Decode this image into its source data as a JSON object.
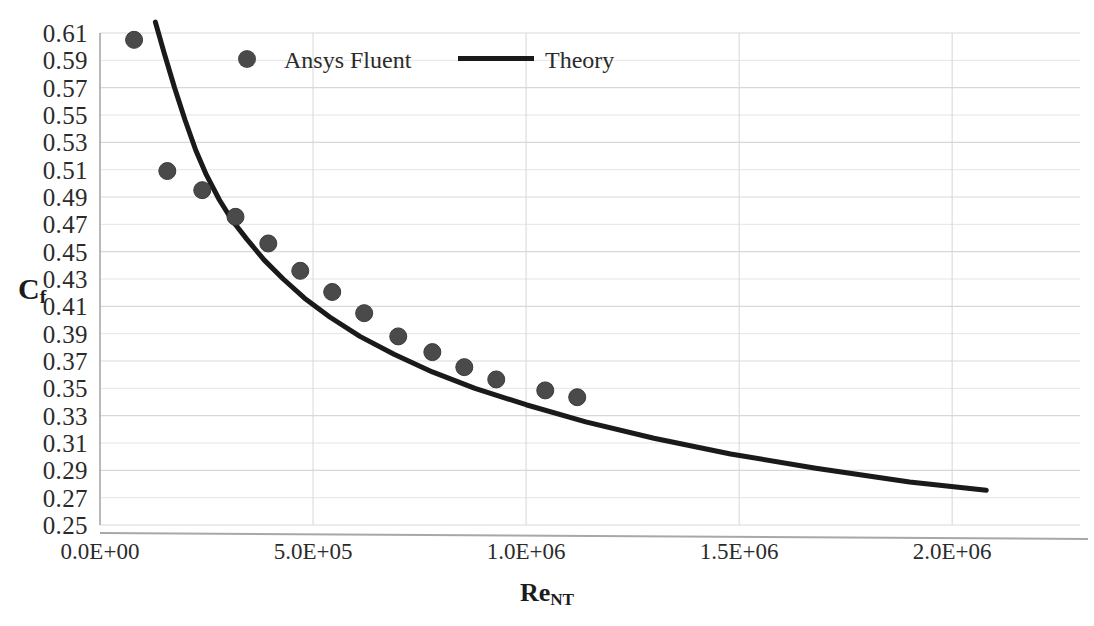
{
  "chart_data": {
    "type": "scatter",
    "title": "",
    "xlabel": "Re_NT",
    "ylabel": "C",
    "xlabel_base": "Re",
    "xlabel_sub": "NT",
    "ylabel_base": "C",
    "ylabel_sub": "f",
    "grid": true,
    "legend_position": "top-center-inside",
    "xlim": [
      0,
      2300000
    ],
    "ylim": [
      0.25,
      0.61
    ],
    "xticks": [
      0,
      500000,
      1000000,
      1500000,
      2000000
    ],
    "xtick_labels": [
      "0.0E+00",
      "5.0E+05",
      "1.0E+06",
      "1.5E+06",
      "2.0E+06"
    ],
    "yticks": [
      0.25,
      0.27,
      0.29,
      0.31,
      0.33,
      0.35,
      0.37,
      0.39,
      0.41,
      0.43,
      0.45,
      0.47,
      0.49,
      0.51,
      0.53,
      0.55,
      0.57,
      0.59,
      0.61
    ],
    "ytick_labels": [
      "0.25",
      "0.27",
      "0.29",
      "0.31",
      "0.33",
      "0.35",
      "0.37",
      "0.39",
      "0.41",
      "0.43",
      "0.45",
      "0.47",
      "0.49",
      "0.51",
      "0.53",
      "0.55",
      "0.57",
      "0.59",
      "0.61"
    ],
    "series": [
      {
        "name": "Ansys Fluent",
        "type": "scatter",
        "marker": "circle",
        "color": "#4a4a4a",
        "marker_size": 17,
        "points": [
          {
            "x": 80000,
            "y": 0.605
          },
          {
            "x": 158000,
            "y": 0.509
          },
          {
            "x": 240000,
            "y": 0.495
          },
          {
            "x": 318000,
            "y": 0.4755
          },
          {
            "x": 395000,
            "y": 0.456
          },
          {
            "x": 470000,
            "y": 0.436
          },
          {
            "x": 545000,
            "y": 0.4205
          },
          {
            "x": 620000,
            "y": 0.405
          },
          {
            "x": 700000,
            "y": 0.388
          },
          {
            "x": 780000,
            "y": 0.3765
          },
          {
            "x": 855000,
            "y": 0.3655
          },
          {
            "x": 930000,
            "y": 0.3565
          },
          {
            "x": 1045000,
            "y": 0.3485
          },
          {
            "x": 1120000,
            "y": 0.3435
          }
        ]
      },
      {
        "name": "Theory",
        "type": "line",
        "color": "#1a1a1a",
        "line_width": 5,
        "points": [
          {
            "x": 130000,
            "y": 0.618
          },
          {
            "x": 150000,
            "y": 0.596
          },
          {
            "x": 175000,
            "y": 0.57
          },
          {
            "x": 200000,
            "y": 0.546
          },
          {
            "x": 225000,
            "y": 0.524
          },
          {
            "x": 250000,
            "y": 0.506
          },
          {
            "x": 280000,
            "y": 0.488
          },
          {
            "x": 310000,
            "y": 0.473
          },
          {
            "x": 345000,
            "y": 0.459
          },
          {
            "x": 385000,
            "y": 0.444
          },
          {
            "x": 430000,
            "y": 0.43
          },
          {
            "x": 480000,
            "y": 0.416
          },
          {
            "x": 540000,
            "y": 0.402
          },
          {
            "x": 610000,
            "y": 0.388
          },
          {
            "x": 690000,
            "y": 0.375
          },
          {
            "x": 780000,
            "y": 0.362
          },
          {
            "x": 880000,
            "y": 0.35
          },
          {
            "x": 1000000,
            "y": 0.338
          },
          {
            "x": 1140000,
            "y": 0.3255
          },
          {
            "x": 1300000,
            "y": 0.3135
          },
          {
            "x": 1480000,
            "y": 0.302
          },
          {
            "x": 1680000,
            "y": 0.2915
          },
          {
            "x": 1900000,
            "y": 0.2815
          },
          {
            "x": 2080000,
            "y": 0.2755
          }
        ]
      }
    ],
    "colors": {
      "marker": "#4a4a4a",
      "line": "#1a1a1a",
      "gridline": "#d6d6d6",
      "axis": "#a8a8a8",
      "text": "#2b2b2b",
      "background": "#ffffff"
    }
  }
}
